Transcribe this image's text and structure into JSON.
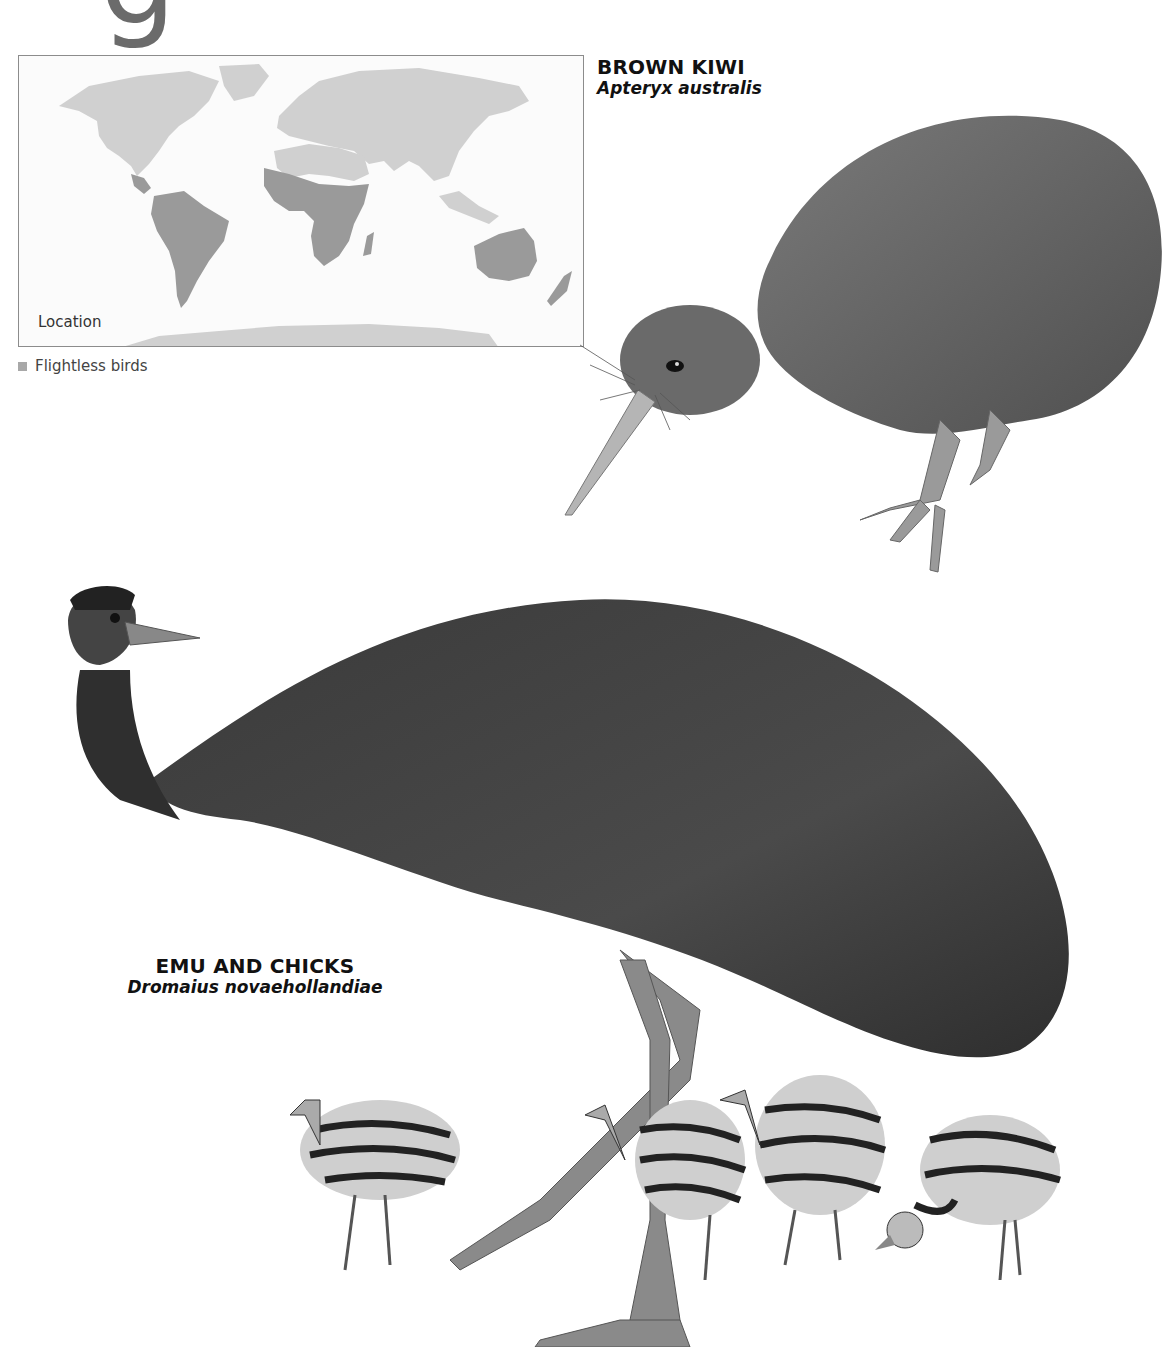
{
  "page": {
    "heading_fragment": "g"
  },
  "map": {
    "label": "Location",
    "legend": {
      "swatch_color": "#a8a8a8",
      "label": "Flightless birds"
    },
    "colors": {
      "land": "#d0d0d0",
      "range_highlight": "#9a9a9a",
      "border": "#8c8c8c",
      "background": "#fbfbfb"
    },
    "highlighted_regions": [
      "Central America",
      "South America",
      "Sub-Saharan Africa",
      "Madagascar",
      "Australia",
      "New Zealand"
    ]
  },
  "species": [
    {
      "id": "kiwi",
      "common_name": "BROWN KIWI",
      "latin_name": "Apteryx australis",
      "illustration": "brown-kiwi-illustration"
    },
    {
      "id": "emu",
      "common_name": "EMU AND CHICKS",
      "latin_name": "Dromaius novaehollandiae",
      "illustration": "emu-and-chicks-illustration",
      "chick_count": 4
    }
  ]
}
